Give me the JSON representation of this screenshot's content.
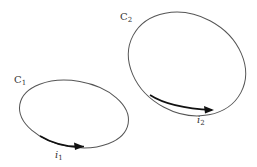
{
  "diagram": {
    "loops": [
      {
        "name": "C",
        "subscript": "1",
        "current": "i",
        "current_sub": "1"
      },
      {
        "name": "C",
        "subscript": "2",
        "current": "i",
        "current_sub": "2"
      }
    ],
    "colors": {
      "stroke": "#555555",
      "arrow": "#111111",
      "text": "#333333"
    }
  }
}
